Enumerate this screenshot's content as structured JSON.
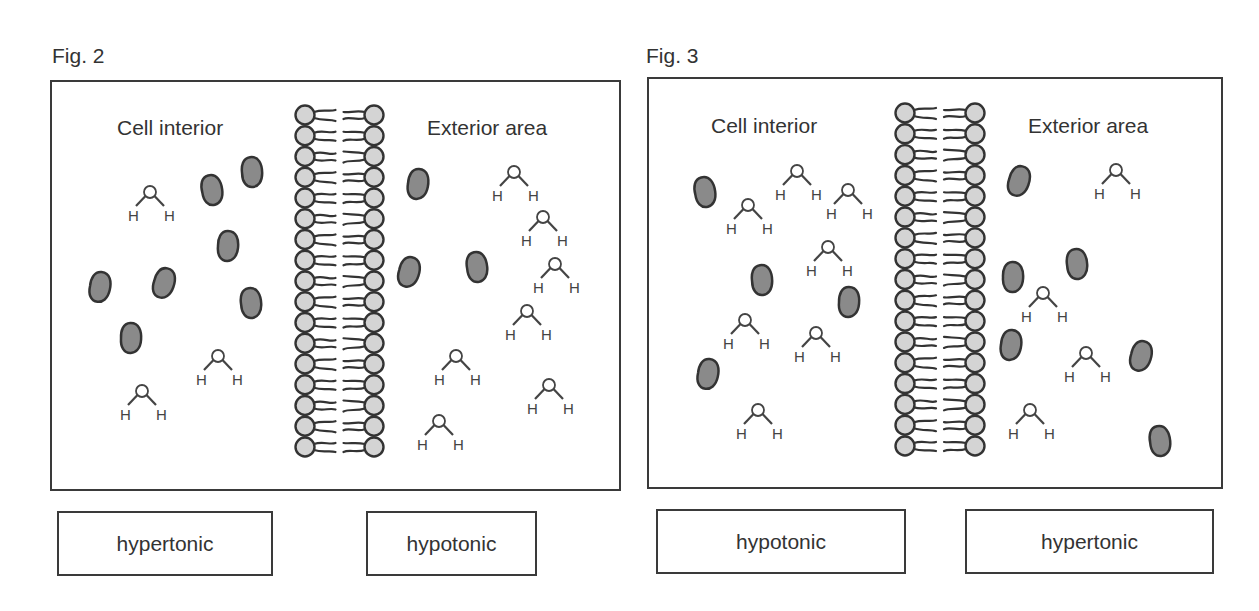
{
  "figures": [
    {
      "title": "Fig. 2",
      "interior_label": "Cell interior",
      "exterior_label": "Exterior area",
      "interior_tonicity": "hypertonic",
      "exterior_tonicity": "hypotonic",
      "membrane": {
        "left_x": 305,
        "right_x": 374,
        "y_start": 115,
        "y_end": 447,
        "head_count": 17
      },
      "solutes": [
        [
          212,
          190
        ],
        [
          252,
          172
        ],
        [
          228,
          246
        ],
        [
          100,
          287
        ],
        [
          164,
          283
        ],
        [
          251,
          303
        ],
        [
          131,
          338
        ],
        [
          418,
          184
        ],
        [
          409,
          272
        ],
        [
          477,
          267
        ]
      ],
      "water": [
        [
          150,
          192
        ],
        [
          218,
          356
        ],
        [
          142,
          391
        ],
        [
          514,
          172
        ],
        [
          543,
          217
        ],
        [
          555,
          264
        ],
        [
          527,
          311
        ],
        [
          456,
          356
        ],
        [
          549,
          385
        ],
        [
          439,
          421
        ]
      ]
    },
    {
      "title": "Fig. 3",
      "interior_label": "Cell interior",
      "exterior_label": "Exterior area",
      "interior_tonicity": "hypotonic",
      "exterior_tonicity": "hypertonic",
      "membrane": {
        "left_x": 905,
        "right_x": 975,
        "y_start": 113,
        "y_end": 446,
        "head_count": 17
      },
      "solutes": [
        [
          705,
          192
        ],
        [
          762,
          280
        ],
        [
          849,
          302
        ],
        [
          708,
          374
        ],
        [
          1019,
          181
        ],
        [
          1077,
          264
        ],
        [
          1013,
          277
        ],
        [
          1011,
          345
        ],
        [
          1141,
          356
        ],
        [
          1160,
          441
        ]
      ],
      "water": [
        [
          797,
          171
        ],
        [
          748,
          205
        ],
        [
          848,
          190
        ],
        [
          828,
          247
        ],
        [
          745,
          320
        ],
        [
          816,
          333
        ],
        [
          758,
          410
        ],
        [
          1116,
          170
        ],
        [
          1043,
          293
        ],
        [
          1086,
          353
        ],
        [
          1030,
          410
        ]
      ]
    }
  ],
  "molecule_labels": {
    "oxygen": "O",
    "hydrogen": "H"
  },
  "colors": {
    "stroke": "#333333",
    "solute_fill": "#8a8a8a",
    "head_fill": "#d4d4d4",
    "background": "#ffffff"
  }
}
